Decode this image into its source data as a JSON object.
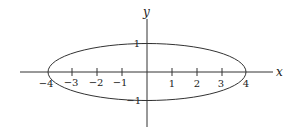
{
  "diagram": {
    "type": "ellipse-plot",
    "equation_shape": "x^2/16 + y^2 = 1",
    "axes": {
      "x_label": "x",
      "y_label": "y"
    },
    "x_ticks": [
      {
        "value": -4,
        "label": "−4"
      },
      {
        "value": -3,
        "label": "−3"
      },
      {
        "value": -2,
        "label": "−2"
      },
      {
        "value": -1,
        "label": "−1"
      },
      {
        "value": 1,
        "label": "1"
      },
      {
        "value": 2,
        "label": "2"
      },
      {
        "value": 3,
        "label": "3"
      },
      {
        "value": 4,
        "label": "4"
      }
    ],
    "y_ticks": [
      {
        "value": 1,
        "label": "1"
      },
      {
        "value": -1,
        "label": "−1"
      }
    ],
    "ellipse": {
      "cx": 0,
      "cy": 0,
      "rx": 4,
      "ry": 1
    },
    "colors": {
      "stroke": "#333333",
      "background": "#ffffff"
    }
  }
}
